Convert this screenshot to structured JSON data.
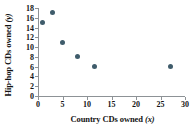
{
  "chart_data": {
    "type": "scatter",
    "title": "",
    "xlabel": "Country CDs owned (x)",
    "ylabel": "Hip-hop CDs owned (y)",
    "xlabel_text": "Country CDs owned",
    "xlabel_var": "(x)",
    "ylabel_text": "Hip-hop CDs owned",
    "ylabel_var": "(y)",
    "xlim": [
      0,
      30
    ],
    "ylim": [
      0,
      18
    ],
    "xticks": [
      0,
      5,
      10,
      15,
      20,
      25,
      30
    ],
    "yticks": [
      0,
      2,
      4,
      6,
      8,
      10,
      12,
      14,
      16,
      18
    ],
    "xtick_labels": [
      "0",
      "5",
      "10",
      "15",
      "20",
      "25",
      "30"
    ],
    "ytick_labels": [
      "0",
      "2",
      "4",
      "6",
      "8",
      "10",
      "12",
      "14",
      "16",
      "18"
    ],
    "grid": false,
    "legend": false,
    "marker_color": "#3f5c6b",
    "axis_color": "#8d9296",
    "text_color": "#141414",
    "background": "#ffffff",
    "points": [
      {
        "x": 1,
        "y": 15
      },
      {
        "x": 3,
        "y": 17
      },
      {
        "x": 5,
        "y": 11
      },
      {
        "x": 8,
        "y": 8
      },
      {
        "x": 11.5,
        "y": 6
      },
      {
        "x": 27,
        "y": 6
      }
    ]
  }
}
